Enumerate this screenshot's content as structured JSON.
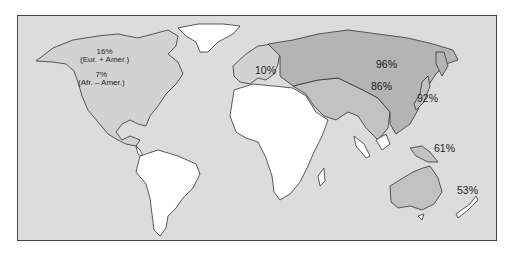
{
  "map": {
    "type": "world-choropleth",
    "colors": {
      "ocean": "#dcdcdc",
      "low": "#ffffff",
      "mid": "#d2d2d2",
      "high": "#b4b4b4",
      "border": "#333333"
    },
    "labels": {
      "north_america_eur": {
        "value": "16%",
        "group": "(Eur. + Amer.)"
      },
      "north_america_afr": {
        "value": "7%",
        "group": "(Afr. – Amer.)"
      },
      "europe": "10%",
      "siberia": "96%",
      "china": "86%",
      "japan": "92%",
      "new_guinea": "61%",
      "australia": "53%"
    }
  }
}
